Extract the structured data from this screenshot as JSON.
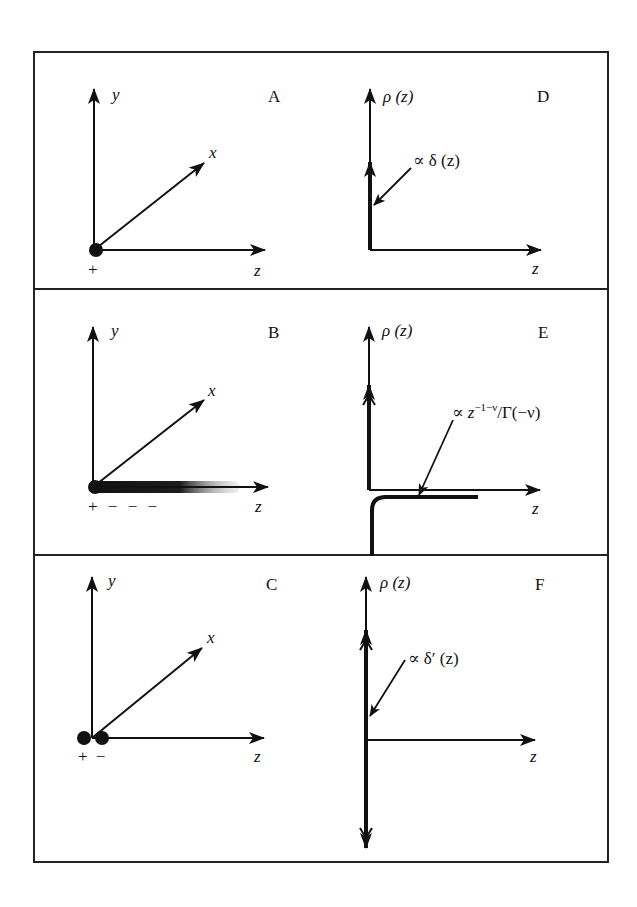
{
  "figure": {
    "panels": [
      {
        "id": "A",
        "label": "A",
        "axes": {
          "y": "y",
          "x": "x",
          "z": "z"
        },
        "charges": [
          "+"
        ],
        "description": "single point charge at origin"
      },
      {
        "id": "B",
        "label": "B",
        "axes": {
          "y": "y",
          "x": "x",
          "z": "z"
        },
        "charges": [
          "+",
          "−",
          "−",
          "−"
        ],
        "charge_label": "+ − − −",
        "description": "point charge with fading negative line charge along z"
      },
      {
        "id": "C",
        "label": "C",
        "axes": {
          "y": "y",
          "x": "x",
          "z": "z"
        },
        "charges": [
          "+",
          "−"
        ],
        "charge_label": "+ −",
        "description": "dipole of two point charges"
      },
      {
        "id": "D",
        "label": "D",
        "y_axis": "ρ (z)",
        "x_axis": "z",
        "annotation": "∝ δ (z)"
      },
      {
        "id": "E",
        "label": "E",
        "y_axis": "ρ (z)",
        "x_axis": "z",
        "annotation_prefix": "∝ z",
        "annotation_sup": "−1−ν",
        "annotation_suffix": "/Γ(−ν)"
      },
      {
        "id": "F",
        "label": "F",
        "y_axis": "ρ (z)",
        "x_axis": "z",
        "annotation": "∝ δ′ (z)"
      }
    ],
    "colors": {
      "ink": "#111111",
      "background": "#ffffff",
      "border": "#222222"
    }
  }
}
